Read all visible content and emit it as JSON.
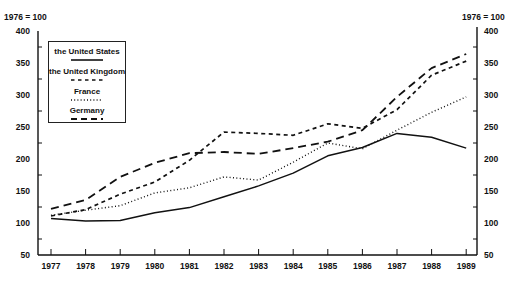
{
  "chart_data": {
    "type": "line",
    "title": "",
    "xlabel": "",
    "ylabel": "1976 = 100",
    "y_right_label": "1976 = 100",
    "x": [
      1977,
      1978,
      1979,
      1980,
      1981,
      1982,
      1983,
      1984,
      1985,
      1986,
      1987,
      1988,
      1989
    ],
    "x_tick_labels": [
      "1977",
      "1978",
      "1979",
      "1980",
      "1981",
      "1982",
      "1983",
      "1984",
      "1985",
      "1986",
      "1987",
      "1988",
      "1989"
    ],
    "ylim": [
      50,
      400
    ],
    "y_ticks": [
      50,
      100,
      150,
      200,
      250,
      300,
      350,
      400
    ],
    "y_tick_labels": [
      "50",
      "100",
      "150",
      "200",
      "250",
      "300",
      "350",
      "400"
    ],
    "grid": false,
    "dual_y_axis": true,
    "legend_position": "upper left",
    "series": [
      {
        "name": "the United States",
        "style": "solid",
        "values": [
          107,
          103,
          104,
          116,
          124,
          141,
          158,
          178,
          205,
          218,
          240,
          234,
          217
        ]
      },
      {
        "name": "the United Kingdom",
        "style": "short-dash",
        "values": [
          111,
          121,
          145,
          164,
          198,
          242,
          240,
          237,
          255,
          248,
          277,
          331,
          353
        ]
      },
      {
        "name": "France",
        "style": "dotted",
        "values": [
          112,
          120,
          127,
          147,
          155,
          172,
          167,
          195,
          225,
          216,
          245,
          273,
          297
        ]
      },
      {
        "name": "Germany",
        "style": "long-dash",
        "values": [
          122,
          136,
          172,
          194,
          209,
          211,
          208,
          217,
          227,
          245,
          297,
          342,
          364
        ]
      }
    ]
  },
  "legend": {
    "items": [
      {
        "label": "the United States"
      },
      {
        "label": "the United Kingdom"
      },
      {
        "label": "France"
      },
      {
        "label": "Germany"
      }
    ]
  },
  "axes": {
    "left_base_label": "1976 = 100",
    "right_base_label": "1976 = 100"
  },
  "colors": {
    "line": "#111111",
    "axis": "#111111",
    "background": "#ffffff"
  }
}
